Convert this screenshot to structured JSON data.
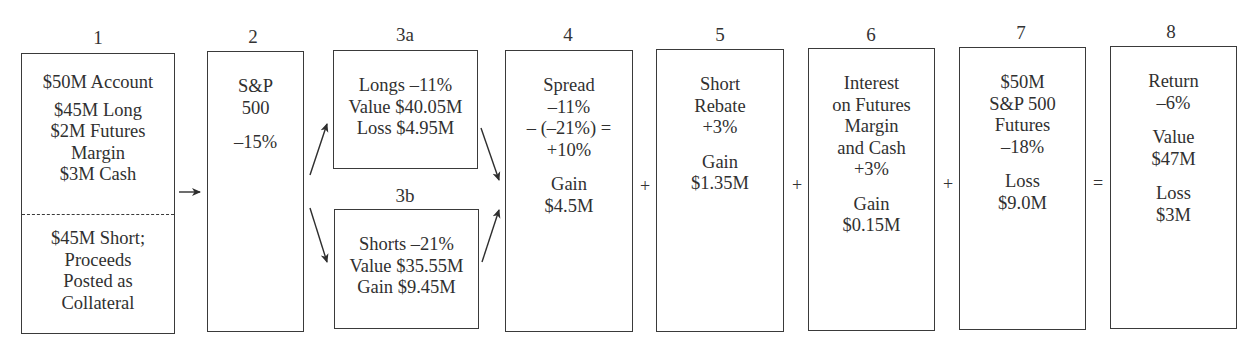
{
  "diagram": {
    "steps": [
      {
        "id": "1",
        "label": "1",
        "top_lines": [
          "$50M Account"
        ],
        "top_lines_2": [
          "$45M Long",
          "$2M Futures",
          "Margin",
          "$3M Cash"
        ],
        "bottom_lines": [
          "$45M Short;",
          "Proceeds",
          "Posted as",
          "Collateral"
        ]
      },
      {
        "id": "2",
        "label": "2",
        "lines": [
          "S&P",
          "500"
        ],
        "lines_2": [
          "–15%"
        ]
      },
      {
        "id": "3a",
        "label": "3a",
        "lines": [
          "Longs –11%",
          "Value $40.05M",
          "Loss $4.95M"
        ]
      },
      {
        "id": "3b",
        "label": "3b",
        "lines": [
          "Shorts –21%",
          "Value $35.55M",
          "Gain $9.45M"
        ]
      },
      {
        "id": "4",
        "label": "4",
        "lines": [
          "Spread",
          "–11%",
          "– (–21%) =",
          "+10%"
        ],
        "lines_2": [
          "Gain",
          "$4.5M"
        ]
      },
      {
        "id": "5",
        "label": "5",
        "lines": [
          "Short",
          "Rebate",
          "+3%"
        ],
        "lines_2": [
          "Gain",
          "$1.35M"
        ]
      },
      {
        "id": "6",
        "label": "6",
        "lines": [
          "Interest",
          "on Futures",
          "Margin",
          "and Cash",
          "+3%"
        ],
        "lines_2": [
          "Gain",
          "$0.15M"
        ]
      },
      {
        "id": "7",
        "label": "7",
        "lines": [
          "$50M",
          "S&P 500",
          "Futures",
          "–18%"
        ],
        "lines_2": [
          "Loss",
          "$9.0M"
        ]
      },
      {
        "id": "8",
        "label": "8",
        "lines": [
          "Return",
          "–6%"
        ],
        "lines_2": [
          "Value",
          "$47M"
        ],
        "lines_3": [
          "Loss",
          "$3M"
        ]
      }
    ],
    "operators": {
      "plus_4_5": "+",
      "plus_5_6": "+",
      "plus_6_7": "+",
      "equals_7_8": "="
    },
    "colors": {
      "line": "#3a3a3a",
      "text": "#303030",
      "background": "#ffffff"
    }
  }
}
